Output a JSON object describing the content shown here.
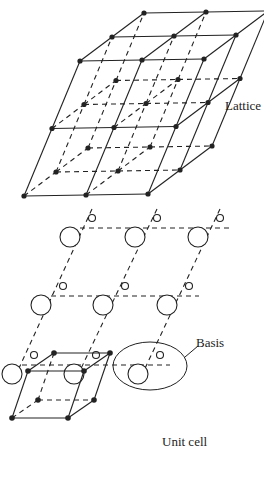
{
  "labels": {
    "lattice": "Lattice",
    "basis": "Basis",
    "unit_cell": "Unit cell"
  },
  "colors": {
    "ink": "#222222",
    "background": "#ffffff"
  },
  "lattice": {
    "origin": [
      24,
      196
    ],
    "a": [
      62,
      -1
    ],
    "b": [
      28,
      -67.5
    ],
    "c": [
      32,
      -24
    ],
    "counts": [
      2,
      2,
      2
    ]
  },
  "basis_grid": {
    "rows": [
      [
        [
          70,
          237
        ],
        [
          135,
          237
        ],
        [
          198,
          237
        ]
      ],
      [
        [
          41,
          305
        ],
        [
          103,
          305
        ],
        [
          167,
          305
        ]
      ],
      [
        [
          12,
          374
        ],
        [
          74,
          374
        ],
        [
          138,
          374
        ]
      ]
    ],
    "big_r": 10,
    "small_r": 3.5,
    "small_offset": [
      22,
      -19
    ]
  },
  "unit_cell": {
    "front": [
      [
        12,
        418
      ],
      [
        68,
        418
      ],
      [
        84,
        371
      ],
      [
        28,
        371
      ]
    ],
    "back_offset": [
      26,
      -18
    ]
  }
}
